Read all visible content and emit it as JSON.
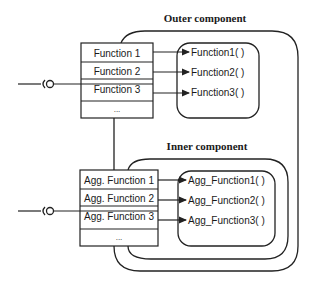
{
  "diagram": {
    "outer_component": {
      "label": "Outer component",
      "interface_rows": [
        "Function 1",
        "Function 2",
        "Function 3",
        "..."
      ],
      "functions": [
        "Function1( )",
        "Function2( )",
        "Function3( )"
      ]
    },
    "inner_component": {
      "label": "Inner component",
      "interface_rows": [
        "Agg. Function 1",
        "Agg. Function 2",
        "Agg. Function 3",
        "..."
      ],
      "functions": [
        "Agg_Function1( )",
        "Agg_Function2( )",
        "Agg_Function3( )"
      ]
    },
    "colors": {
      "line": "#222222",
      "background": "#ffffff"
    }
  }
}
